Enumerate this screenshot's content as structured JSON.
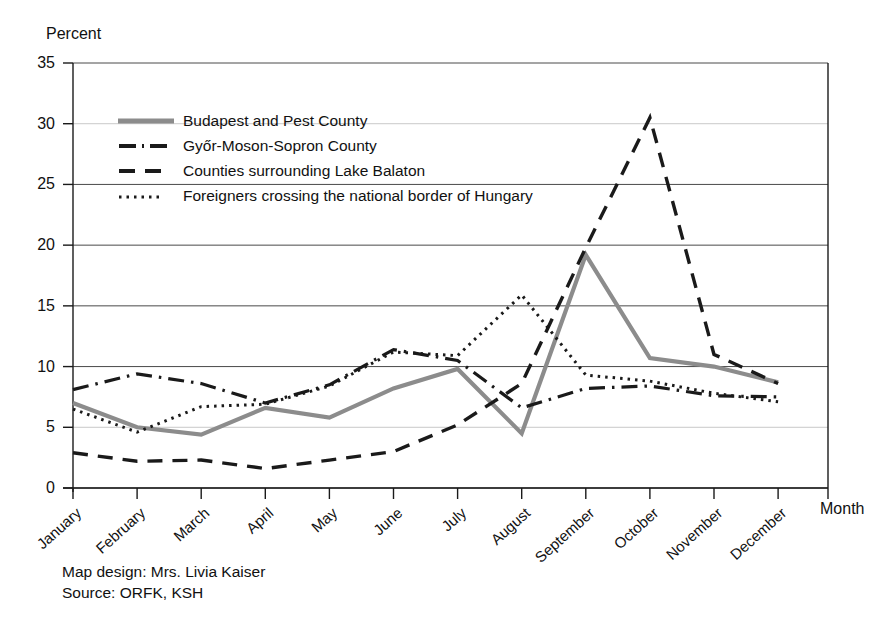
{
  "axes": {
    "y_title": "Percent",
    "x_title": "Month",
    "y_ticks": [
      "35",
      "30",
      "25",
      "20",
      "15",
      "10",
      "5",
      "0"
    ],
    "x_ticks": [
      "January",
      "February",
      "March",
      "April",
      "May",
      "June",
      "July",
      "August",
      "September",
      "October",
      "November",
      "December"
    ]
  },
  "legend": {
    "items": [
      {
        "label": "Budapest and Pest County",
        "style": "solid-gray",
        "color": "#8c8c8c"
      },
      {
        "label": "Győr-Moson-Sopron County",
        "style": "dash-dot",
        "color": "#1a1a1a"
      },
      {
        "label": "Counties surrounding Lake Balaton",
        "style": "dashed",
        "color": "#1a1a1a"
      },
      {
        "label": "Foreigners crossing the national border of Hungary",
        "style": "dotted",
        "color": "#1a1a1a"
      }
    ]
  },
  "footer": {
    "line1": "Map design: Mrs. Livia Kaiser",
    "line2": "Source: ORFK, KSH"
  },
  "chart_data": {
    "type": "line",
    "title": "",
    "xlabel": "Month",
    "ylabel": "Percent",
    "ylim": [
      0,
      35
    ],
    "ytick_step": 5,
    "grid": true,
    "legend_position": "upper-left-inside",
    "categories": [
      "January",
      "February",
      "March",
      "April",
      "May",
      "June",
      "July",
      "August",
      "September",
      "October",
      "November",
      "December"
    ],
    "series": [
      {
        "name": "Budapest and Pest County",
        "linestyle": "solid",
        "color": "#8c8c8c",
        "values": [
          7.0,
          5.0,
          4.4,
          6.6,
          5.8,
          8.2,
          9.8,
          4.5,
          19.2,
          10.7,
          10.0,
          8.7
        ]
      },
      {
        "name": "Győr-Moson-Sopron County",
        "linestyle": "dashdot",
        "color": "#1a1a1a",
        "values": [
          8.1,
          9.4,
          8.6,
          7.0,
          8.5,
          11.4,
          10.5,
          6.6,
          8.2,
          8.4,
          7.6,
          7.5
        ]
      },
      {
        "name": "Counties surrounding Lake Balaton",
        "linestyle": "dashed",
        "color": "#1a1a1a",
        "values": [
          2.9,
          2.2,
          2.3,
          1.6,
          2.3,
          3.0,
          5.2,
          8.6,
          19.8,
          30.5,
          11.0,
          8.6
        ]
      },
      {
        "name": "Foreigners crossing the national border of Hungary",
        "linestyle": "dotted",
        "color": "#1a1a1a",
        "values": [
          6.5,
          4.6,
          6.7,
          6.9,
          8.4,
          11.2,
          10.9,
          15.9,
          9.3,
          8.8,
          7.8,
          7.1
        ]
      }
    ]
  }
}
